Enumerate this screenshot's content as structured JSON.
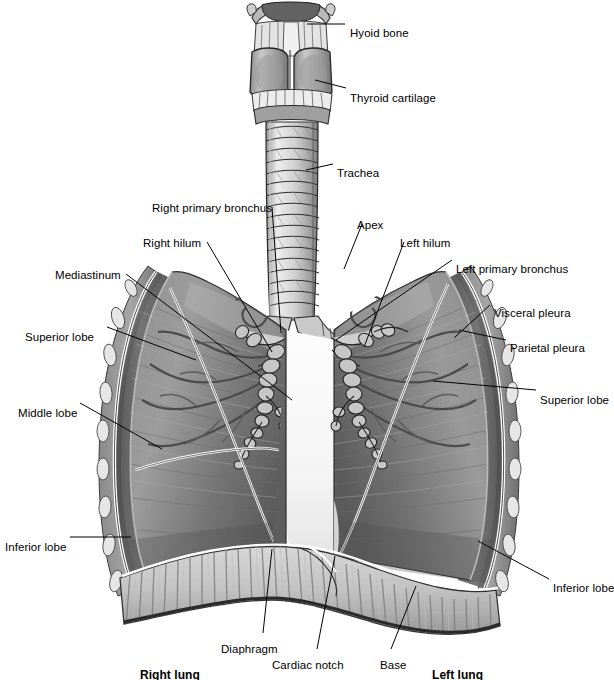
{
  "figure": {
    "style": "grayscale medical illustration",
    "width": 614,
    "height": 680,
    "background_color": "#ffffff",
    "line_color": "#000000"
  },
  "labels": [
    {
      "id": "hyoid-bone",
      "text": "Hyoid bone",
      "x": 350,
      "y": 27,
      "align": "start",
      "bold": false,
      "leader": {
        "x1": 307,
        "y1": 24,
        "x2": 345,
        "y2": 24
      }
    },
    {
      "id": "thyroid-cartilage",
      "text": "Thyroid cartilage",
      "x": 350,
      "y": 92,
      "align": "start",
      "bold": false,
      "leader": {
        "x1": 315,
        "y1": 80,
        "x2": 346,
        "y2": 88
      }
    },
    {
      "id": "trachea",
      "text": "Trachea",
      "x": 337,
      "y": 167,
      "align": "start",
      "bold": false,
      "leader": {
        "x1": 306,
        "y1": 170,
        "x2": 333,
        "y2": 164
      }
    },
    {
      "id": "right-primary-bronchus",
      "text": "Right primary bronchus",
      "x": 152,
      "y": 202,
      "align": "start",
      "bold": false,
      "leader": {
        "x1": 272,
        "y1": 207,
        "x2": 281,
        "y2": 333
      }
    },
    {
      "id": "right-hilum",
      "text": "Right hilum",
      "x": 143,
      "y": 237,
      "align": "start",
      "bold": false,
      "leader": {
        "x1": 207,
        "y1": 242,
        "x2": 272,
        "y2": 352
      }
    },
    {
      "id": "apex",
      "text": "Apex",
      "x": 357,
      "y": 219,
      "align": "start",
      "bold": false,
      "leader": {
        "x1": 362,
        "y1": 224,
        "x2": 344,
        "y2": 269
      }
    },
    {
      "id": "left-hilum",
      "text": "Left hilum",
      "x": 400,
      "y": 237,
      "align": "start",
      "bold": false,
      "leader": {
        "x1": 404,
        "y1": 242,
        "x2": 364,
        "y2": 347
      }
    },
    {
      "id": "left-primary-bronchus",
      "text": "Left primary bronchus",
      "x": 456,
      "y": 263,
      "align": "start",
      "bold": false,
      "leader": {
        "x1": 452,
        "y1": 260,
        "x2": 336,
        "y2": 340
      }
    },
    {
      "id": "mediastinum",
      "text": "Mediastinum",
      "x": 55,
      "y": 269,
      "align": "start",
      "bold": false,
      "leader": {
        "x1": 126,
        "y1": 274,
        "x2": 292,
        "y2": 400
      }
    },
    {
      "id": "visceral-pleura",
      "text": "Visceral pleura",
      "x": 494,
      "y": 307,
      "align": "start",
      "bold": false,
      "leader": {
        "x1": 490,
        "y1": 305,
        "x2": 454,
        "y2": 338
      }
    },
    {
      "id": "parietal-pleura",
      "text": "Parietal pleura",
      "x": 510,
      "y": 342,
      "align": "start",
      "bold": false,
      "leader": {
        "x1": 506,
        "y1": 340,
        "x2": 459,
        "y2": 330
      }
    },
    {
      "id": "superior-lobe-right",
      "text": "Superior lobe",
      "x": 25,
      "y": 331,
      "align": "start",
      "bold": false,
      "leader": {
        "x1": 107,
        "y1": 327,
        "x2": 196,
        "y2": 360
      }
    },
    {
      "id": "superior-lobe-left",
      "text": "Superior lobe",
      "x": 540,
      "y": 394,
      "align": "start",
      "bold": false,
      "leader": {
        "x1": 536,
        "y1": 390,
        "x2": 433,
        "y2": 381
      }
    },
    {
      "id": "middle-lobe",
      "text": "Middle lobe",
      "x": 18,
      "y": 407,
      "align": "start",
      "bold": false,
      "leader": {
        "x1": 80,
        "y1": 403,
        "x2": 162,
        "y2": 449
      }
    },
    {
      "id": "inferior-lobe-right",
      "text": "Inferior lobe",
      "x": 5,
      "y": 541,
      "align": "start",
      "bold": false,
      "leader": {
        "x1": 70,
        "y1": 537,
        "x2": 131,
        "y2": 537
      }
    },
    {
      "id": "inferior-lobe-left",
      "text": "Inferior lobe",
      "x": 553,
      "y": 582,
      "align": "start",
      "bold": false,
      "leader": {
        "x1": 549,
        "y1": 579,
        "x2": 478,
        "y2": 541
      }
    },
    {
      "id": "diaphragm",
      "text": "Diaphragm",
      "x": 221,
      "y": 643,
      "align": "start",
      "bold": false,
      "leader": {
        "x1": 263,
        "y1": 633,
        "x2": 272,
        "y2": 549
      }
    },
    {
      "id": "cardiac-notch",
      "text": "Cardiac notch",
      "x": 272,
      "y": 659,
      "align": "start",
      "bold": false,
      "leader": {
        "x1": 317,
        "y1": 649,
        "x2": 335,
        "y2": 556
      }
    },
    {
      "id": "base",
      "text": "Base",
      "x": 380,
      "y": 659,
      "align": "start",
      "bold": false,
      "leader": {
        "x1": 391,
        "y1": 649,
        "x2": 416,
        "y2": 586
      }
    },
    {
      "id": "right-lung",
      "text": "Right lung",
      "x": 140,
      "y": 669,
      "align": "start",
      "bold": true,
      "leader": null
    },
    {
      "id": "left-lung",
      "text": "Left lung",
      "x": 432,
      "y": 669,
      "align": "start",
      "bold": true,
      "leader": null
    }
  ],
  "structures": [
    {
      "id": "larynx",
      "name": "larynx-with-hyoid-and-thyroid-cartilage"
    },
    {
      "id": "trachea",
      "name": "trachea-cartilage-rings"
    },
    {
      "id": "carina",
      "name": "tracheal-bifurcation"
    },
    {
      "id": "right-lung",
      "name": "right-lung-three-lobes-cutaway"
    },
    {
      "id": "left-lung",
      "name": "left-lung-two-lobes-cutaway"
    },
    {
      "id": "bronchial-tree",
      "name": "bronchial-tree"
    },
    {
      "id": "pulmonary-vessels",
      "name": "pulmonary-vessels"
    },
    {
      "id": "pleura",
      "name": "visceral-and-parietal-pleura"
    },
    {
      "id": "rib-cage",
      "name": "cut-rib-ends-chest-wall"
    },
    {
      "id": "diaphragm",
      "name": "diaphragm-muscle-striations"
    },
    {
      "id": "mediastinum",
      "name": "mediastinal-space"
    }
  ]
}
